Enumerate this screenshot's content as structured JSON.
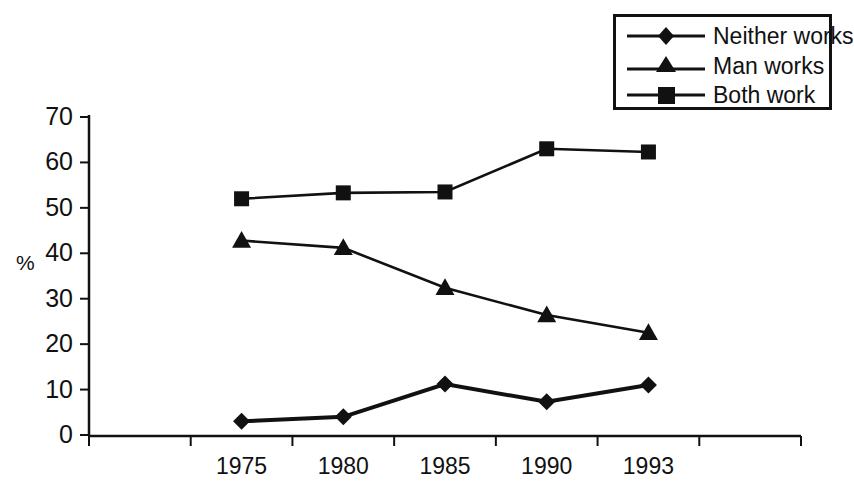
{
  "chart_data": {
    "type": "line",
    "title": "",
    "subtitle": "",
    "xlabel": "",
    "ylabel": "%",
    "categories": [
      "1975",
      "1980",
      "1985",
      "1990",
      "1993"
    ],
    "ylim": [
      0,
      70
    ],
    "yticks": [
      0,
      10,
      20,
      30,
      40,
      50,
      60,
      70
    ],
    "ytick_labels": [
      "0",
      "10",
      "20",
      "30",
      "40",
      "50",
      "60",
      "70"
    ],
    "grid": false,
    "legend_position": "top-right",
    "series": [
      {
        "name": "Neither works",
        "marker": "diamond",
        "color": "#111111",
        "values": [
          3,
          4,
          11.2,
          7.3,
          11
        ]
      },
      {
        "name": "Man works",
        "marker": "triangle",
        "color": "#111111",
        "values": [
          42.8,
          41.2,
          32.4,
          26.4,
          22.5
        ]
      },
      {
        "name": "Both work",
        "marker": "square",
        "color": "#111111",
        "values": [
          52,
          53.3,
          53.5,
          63,
          62.3
        ]
      }
    ],
    "annotations": []
  },
  "legend": {
    "entries": [
      {
        "label": "Neither works",
        "marker": "diamond-marker-icon"
      },
      {
        "label": "Man works",
        "marker": "triangle-marker-icon"
      },
      {
        "label": "Both work",
        "marker": "square-marker-icon"
      }
    ]
  },
  "axes": {
    "y_label": "%",
    "y_ticks": [
      "70",
      "60",
      "50",
      "40",
      "30",
      "20",
      "10",
      "0"
    ],
    "x_ticks": [
      "1975",
      "1980",
      "1985",
      "1990",
      "1993"
    ]
  },
  "colors": {
    "ink": "#111111",
    "background": "#ffffff"
  }
}
